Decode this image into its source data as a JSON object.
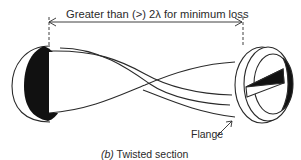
{
  "dimension": {
    "label": "Greater than (>) 2λ for minimum loss"
  },
  "labels": {
    "flange": "Flange"
  },
  "caption": {
    "part": "(b)",
    "text": "Twisted section"
  },
  "colors": {
    "line": "#2a2a2a",
    "fill_dark": "#111111",
    "background": "#ffffff"
  }
}
